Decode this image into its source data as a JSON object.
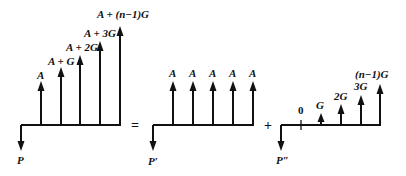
{
  "diagram": {
    "type": "cash-flow-decomposition",
    "operators": {
      "equals": "=",
      "plus": "+"
    },
    "panels": [
      {
        "name": "gradient-series-total",
        "present_value_label": "P",
        "flows": [
          {
            "label": "A"
          },
          {
            "label": "A + G"
          },
          {
            "label": "A + 2G"
          },
          {
            "label": "A + 3G"
          },
          {
            "label": "A + (n−1)G"
          }
        ]
      },
      {
        "name": "uniform-series",
        "present_value_label": "P′",
        "flows": [
          {
            "label": "A"
          },
          {
            "label": "A"
          },
          {
            "label": "A"
          },
          {
            "label": "A"
          },
          {
            "label": "A"
          }
        ]
      },
      {
        "name": "arithmetic-gradient",
        "present_value_label": "P″",
        "flows": [
          {
            "label": "0"
          },
          {
            "label": "G"
          },
          {
            "label": "2G"
          },
          {
            "label": "3G"
          },
          {
            "label": "(n−1)G"
          }
        ]
      }
    ]
  }
}
